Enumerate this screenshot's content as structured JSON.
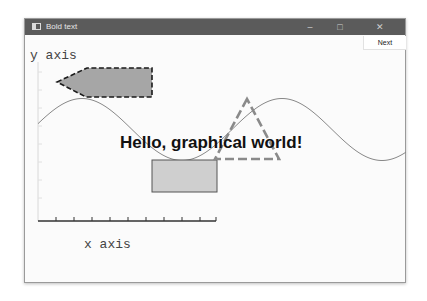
{
  "window": {
    "title": "Bold text",
    "app_icon": "window-icon",
    "controls": {
      "minimize": "–",
      "maximize": "□",
      "close": "✕"
    }
  },
  "toolbar": {
    "next_label": "Next"
  },
  "canvas": {
    "y_axis_label": "y axis",
    "x_axis_label": "x axis",
    "headline": "Hello, graphical world!",
    "colors": {
      "arrow_fill": "#a6a6a6",
      "arrow_stroke": "#1a1a1a",
      "rect_fill": "#cfcfcf",
      "rect_stroke": "#555555",
      "triangle_stroke": "#8a8a8a",
      "sine_stroke": "#888888",
      "axis_stroke": "#333333"
    }
  }
}
